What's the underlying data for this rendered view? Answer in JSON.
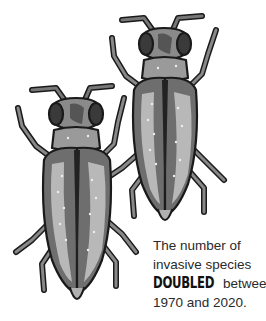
{
  "illustration": {
    "subject": "beetles",
    "count": 2,
    "palette": {
      "outline": "#1a1a1a",
      "dark": "#3a3a3a",
      "mid": "#7a7a7a",
      "light": "#b5b5b5",
      "highlight": "#e0e0e0",
      "background": "#ffffff"
    }
  },
  "caption": {
    "line1": "The number of",
    "line2": "invasive species",
    "emphasis": "DOUBLED",
    "line3_rest": " between",
    "line4": "1970 and 2020."
  }
}
